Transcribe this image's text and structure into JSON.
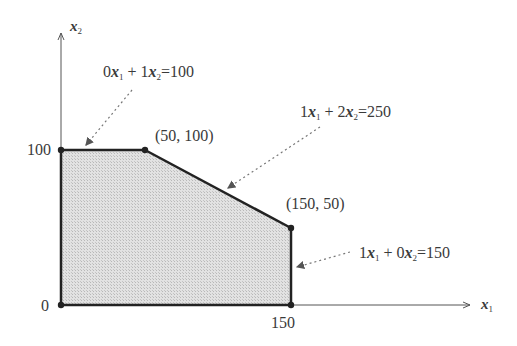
{
  "axes": {
    "x_label": {
      "var": "x",
      "sub": "1"
    },
    "y_label": {
      "var": "x",
      "sub": "2"
    },
    "x_ticks": [
      "0",
      "150"
    ],
    "y_ticks": [
      "100"
    ]
  },
  "constraints": [
    {
      "c1": "0",
      "c2": "1",
      "rhs": "100",
      "equation": "0x1 + 1x2=100"
    },
    {
      "c1": "1",
      "c2": "2",
      "rhs": "250",
      "equation": "1x1 + 2x2=250"
    },
    {
      "c1": "1",
      "c2": "0",
      "rhs": "150",
      "equation": "1x1 + 0x2=150"
    }
  ],
  "vertices": [
    {
      "x": 0,
      "y": 0,
      "label": ""
    },
    {
      "x": 0,
      "y": 100,
      "label": ""
    },
    {
      "x": 50,
      "y": 100,
      "label": "(50,  100)"
    },
    {
      "x": 150,
      "y": 50,
      "label": "(150,  50)"
    },
    {
      "x": 150,
      "y": 0,
      "label": ""
    }
  ],
  "colors": {
    "fill": "#d4d4d4",
    "edge": "#222222",
    "axis": "#555555",
    "pointer": "#777777"
  }
}
